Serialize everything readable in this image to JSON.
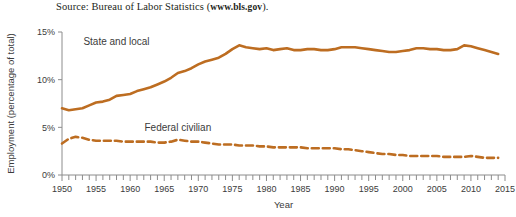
{
  "figure": {
    "source_prefix": "Source: Bureau of Labor Statistics (",
    "source_url": "www.bls.gov",
    "source_suffix": ")."
  },
  "chart_data": {
    "type": "line",
    "title": "",
    "xlabel": "Year",
    "ylabel": "Employment (percentage of total)",
    "xlim": [
      1950,
      2015
    ],
    "ylim": [
      0,
      15
    ],
    "xticks": [
      1950,
      1955,
      1960,
      1965,
      1970,
      1975,
      1980,
      1985,
      1990,
      1995,
      2000,
      2005,
      2010,
      2015
    ],
    "xtick_labels": [
      "1950",
      "1955",
      "1960",
      "1965",
      "1970",
      "1975",
      "1980",
      "1985",
      "1990",
      "1995",
      "2000",
      "2005",
      "2010",
      "2015"
    ],
    "minor_xtick_step": 1,
    "yticks": [
      0,
      5,
      10,
      15
    ],
    "ytick_labels": [
      "0%",
      "5%",
      "10%",
      "15%"
    ],
    "grid": false,
    "legend": "inline-labels",
    "accent_color": "#bd6d21",
    "x": [
      1950,
      1951,
      1952,
      1953,
      1954,
      1955,
      1956,
      1957,
      1958,
      1959,
      1960,
      1961,
      1962,
      1963,
      1964,
      1965,
      1966,
      1967,
      1968,
      1969,
      1970,
      1971,
      1972,
      1973,
      1974,
      1975,
      1976,
      1977,
      1978,
      1979,
      1980,
      1981,
      1982,
      1983,
      1984,
      1985,
      1986,
      1987,
      1988,
      1989,
      1990,
      1991,
      1992,
      1993,
      1994,
      1995,
      1996,
      1997,
      1998,
      1999,
      2000,
      2001,
      2002,
      2003,
      2004,
      2005,
      2006,
      2007,
      2008,
      2009,
      2010,
      2011,
      2012,
      2013,
      2014
    ],
    "series": [
      {
        "name": "State and local",
        "style": "solid",
        "label_x": 1958,
        "label_y": 13.6,
        "values": [
          7.0,
          6.8,
          6.9,
          7.0,
          7.3,
          7.6,
          7.7,
          7.9,
          8.3,
          8.4,
          8.5,
          8.8,
          9.0,
          9.2,
          9.5,
          9.8,
          10.2,
          10.7,
          10.9,
          11.2,
          11.6,
          11.9,
          12.1,
          12.3,
          12.7,
          13.2,
          13.6,
          13.4,
          13.3,
          13.2,
          13.3,
          13.1,
          13.2,
          13.3,
          13.1,
          13.1,
          13.2,
          13.2,
          13.1,
          13.1,
          13.2,
          13.4,
          13.4,
          13.4,
          13.3,
          13.2,
          13.1,
          13.0,
          12.9,
          12.9,
          13.0,
          13.1,
          13.3,
          13.3,
          13.2,
          13.2,
          13.1,
          13.1,
          13.2,
          13.6,
          13.5,
          13.3,
          13.1,
          12.9,
          12.7
        ]
      },
      {
        "name": "Federal civilian",
        "style": "dashed",
        "label_x": 1967,
        "label_y": 4.6,
        "values": [
          3.3,
          3.8,
          4.0,
          3.9,
          3.7,
          3.6,
          3.6,
          3.6,
          3.6,
          3.5,
          3.5,
          3.5,
          3.5,
          3.5,
          3.4,
          3.4,
          3.5,
          3.7,
          3.6,
          3.5,
          3.5,
          3.4,
          3.3,
          3.2,
          3.2,
          3.2,
          3.1,
          3.1,
          3.1,
          3.0,
          3.0,
          2.9,
          2.9,
          2.9,
          2.9,
          2.9,
          2.8,
          2.8,
          2.8,
          2.8,
          2.8,
          2.7,
          2.7,
          2.6,
          2.5,
          2.4,
          2.3,
          2.2,
          2.2,
          2.1,
          2.1,
          2.0,
          2.0,
          2.0,
          2.0,
          2.0,
          1.9,
          1.9,
          1.9,
          1.9,
          2.0,
          1.9,
          1.8,
          1.8,
          1.8
        ]
      }
    ]
  }
}
